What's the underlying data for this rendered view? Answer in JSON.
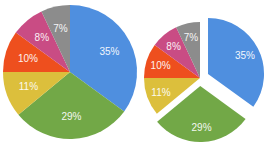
{
  "chart_data": [
    {
      "type": "pie",
      "title": "",
      "variant": "standard",
      "categories": [
        "A",
        "B",
        "C",
        "D",
        "E",
        "F"
      ],
      "values": [
        35,
        29,
        11,
        10,
        8,
        7
      ],
      "labels": [
        "35%",
        "29%",
        "11%",
        "10%",
        "8%",
        "7%"
      ],
      "colors": [
        "#4f8fdf",
        "#72a847",
        "#dcbf3c",
        "#ee4f1e",
        "#c94c84",
        "#8c8c8c"
      ],
      "start_angle": "12 o'clock, clockwise",
      "legend": "none"
    },
    {
      "type": "pie",
      "title": "",
      "variant": "exploded",
      "categories": [
        "A",
        "B",
        "C",
        "D",
        "E",
        "F"
      ],
      "values": [
        35,
        29,
        11,
        10,
        8,
        7
      ],
      "labels": [
        "35%",
        "29%",
        "11%",
        "10%",
        "8%",
        "7%"
      ],
      "colors": [
        "#4f8fdf",
        "#72a847",
        "#dcbf3c",
        "#ee4f1e",
        "#c94c84",
        "#8c8c8c"
      ],
      "exploded_slices": [
        "35%",
        "29%"
      ],
      "start_angle": "12 o'clock, clockwise",
      "legend": "none"
    }
  ]
}
